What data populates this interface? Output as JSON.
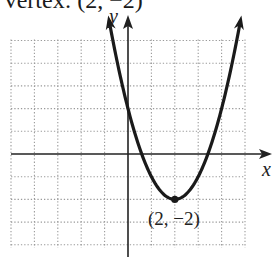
{
  "caption": "Vertex: (2, −2)",
  "chart_data": {
    "type": "line",
    "title": "Vertex: (2, −2)",
    "function": "y = (x - 2)^2 - 2",
    "xlabel": "x",
    "ylabel": "y",
    "xlim": [
      -5,
      5
    ],
    "ylim": [
      -4,
      5
    ],
    "grid": true,
    "grid_style": "dotted",
    "series": [
      {
        "name": "parabola",
        "x": [
          -0.8,
          -0.5,
          0,
          0.5,
          1,
          1.5,
          2,
          2.5,
          3,
          3.5,
          4,
          4.5,
          4.8
        ],
        "values": [
          5.84,
          4.25,
          2,
          0.25,
          -1,
          -1.75,
          -2,
          -1.75,
          -1,
          0.25,
          2,
          4.25,
          5.84
        ]
      }
    ],
    "annotations": [
      {
        "point": [
          2,
          -2
        ],
        "label": "(2, −2)",
        "marker": "filled-circle"
      }
    ]
  },
  "labels": {
    "x_axis": "x",
    "y_axis": "y",
    "vertex": "(2, −2)"
  },
  "colors": {
    "curve": "#1a1a1a",
    "axis": "#222222",
    "grid": "#9a9a9a"
  }
}
